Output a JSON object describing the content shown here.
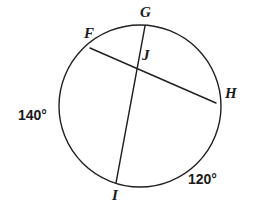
{
  "figure": {
    "type": "circle-with-intersecting-chords",
    "background_color": "#ffffff",
    "stroke_color": "#231f20",
    "circle": {
      "center_x": 140,
      "center_y": 106,
      "radius": 81,
      "stroke_width": 1.4
    },
    "points": [
      {
        "id": "F",
        "label": "F",
        "x": 90,
        "y": 48,
        "label_x": 84,
        "label_y": 26
      },
      {
        "id": "G",
        "label": "G",
        "x": 145,
        "y": 26,
        "label_x": 140,
        "label_y": 5
      },
      {
        "id": "J",
        "label": "J",
        "x": 136,
        "y": 63,
        "label_x": 142,
        "label_y": 48
      },
      {
        "id": "H",
        "label": "H",
        "x": 216,
        "y": 103,
        "label_x": 225,
        "label_y": 86
      },
      {
        "id": "I",
        "label": "I",
        "x": 116,
        "y": 183,
        "label_x": 112,
        "label_y": 188
      }
    ],
    "chords": [
      {
        "id": "chord-FH",
        "from": "F",
        "to": "H",
        "x1": 90,
        "y1": 48,
        "x2": 216,
        "y2": 103
      },
      {
        "id": "chord-GI",
        "from": "G",
        "to": "I",
        "x1": 145,
        "y1": 26,
        "x2": 116,
        "y2": 183
      }
    ],
    "arc_measures": [
      {
        "id": "arc-left",
        "value": "140°",
        "x": 18,
        "y": 108
      },
      {
        "id": "arc-right",
        "value": "120°",
        "x": 188,
        "y": 172
      }
    ]
  }
}
